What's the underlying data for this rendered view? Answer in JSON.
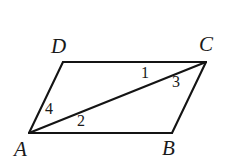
{
  "figure": {
    "kind": "geometry-diagram",
    "shape_name": "parallelogram",
    "background_color": "#ffffff",
    "stroke_color": "#141414",
    "stroke_width": 2.1,
    "canvas": {
      "width": 227,
      "height": 168
    }
  },
  "vertices": [
    {
      "id": "A",
      "label": "A",
      "x": 29,
      "y": 133,
      "label_x": 14,
      "label_y": 139
    },
    {
      "id": "B",
      "label": "B",
      "x": 172,
      "y": 133,
      "label_x": 162,
      "label_y": 138
    },
    {
      "id": "C",
      "label": "C",
      "x": 206,
      "y": 62,
      "label_x": 199,
      "label_y": 34
    },
    {
      "id": "D",
      "label": "D",
      "x": 63,
      "y": 62,
      "label_x": 51,
      "label_y": 36
    }
  ],
  "edges": [
    {
      "id": "AB",
      "from": "A",
      "to": "B",
      "kind": "side"
    },
    {
      "id": "BC",
      "from": "B",
      "to": "C",
      "kind": "side"
    },
    {
      "id": "CD",
      "from": "C",
      "to": "D",
      "kind": "side"
    },
    {
      "id": "DA",
      "from": "D",
      "to": "A",
      "kind": "side"
    },
    {
      "id": "AC",
      "from": "A",
      "to": "C",
      "kind": "diagonal"
    }
  ],
  "angle_labels": [
    {
      "id": "angle-1",
      "label": "1",
      "x": 141,
      "y": 65,
      "at_vertex": "C",
      "between": "CD and CA"
    },
    {
      "id": "angle-3",
      "label": "3",
      "x": 172,
      "y": 74,
      "at_vertex": "C",
      "between": "CA and CB"
    },
    {
      "id": "angle-4",
      "label": "4",
      "x": 45,
      "y": 101,
      "at_vertex": "A",
      "between": "AD and AC"
    },
    {
      "id": "angle-2",
      "label": "2",
      "x": 77,
      "y": 113,
      "at_vertex": "A",
      "between": "AC and AB"
    }
  ]
}
